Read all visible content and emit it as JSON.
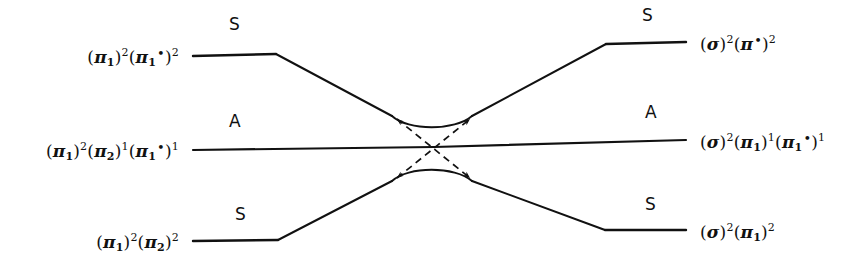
{
  "figure": {
    "type": "orbital-correlation-diagram",
    "background_color": "#ffffff",
    "line_color": "#111111"
  },
  "levels": {
    "left": [
      {
        "id": "left-top",
        "symmetry": "S",
        "config_parts": [
          {
            "t": "(",
            "k": "par"
          },
          {
            "t": "π",
            "k": "gk"
          },
          {
            "t": "1",
            "k": "sub"
          },
          {
            "t": ")",
            "k": "par"
          },
          {
            "t": "2",
            "k": "sup"
          },
          {
            "t": "(",
            "k": "par"
          },
          {
            "t": "π",
            "k": "gk"
          },
          {
            "t": "1",
            "k": "sub"
          },
          {
            "t": "•",
            "k": "star"
          },
          {
            "t": ")",
            "k": "par"
          },
          {
            "t": "2",
            "k": "sup"
          }
        ],
        "config_text": "(π1)2(π1*)2"
      },
      {
        "id": "left-middle",
        "symmetry": "A",
        "config_parts": [
          {
            "t": "(",
            "k": "par"
          },
          {
            "t": "π",
            "k": "gk"
          },
          {
            "t": "1",
            "k": "sub"
          },
          {
            "t": ")",
            "k": "par"
          },
          {
            "t": "2",
            "k": "sup"
          },
          {
            "t": "(",
            "k": "par"
          },
          {
            "t": "π",
            "k": "gk"
          },
          {
            "t": "2",
            "k": "sub"
          },
          {
            "t": ")",
            "k": "par"
          },
          {
            "t": "1",
            "k": "sup"
          },
          {
            "t": "(",
            "k": "par"
          },
          {
            "t": "π",
            "k": "gk"
          },
          {
            "t": "1",
            "k": "sub"
          },
          {
            "t": "•",
            "k": "star"
          },
          {
            "t": ")",
            "k": "par"
          },
          {
            "t": "1",
            "k": "sup"
          }
        ],
        "config_text": "(π1)2(π2)1(π1*)1"
      },
      {
        "id": "left-bottom",
        "symmetry": "S",
        "config_parts": [
          {
            "t": "(",
            "k": "par"
          },
          {
            "t": "π",
            "k": "gk"
          },
          {
            "t": "1",
            "k": "sub"
          },
          {
            "t": ")",
            "k": "par"
          },
          {
            "t": "2",
            "k": "sup"
          },
          {
            "t": "(",
            "k": "par"
          },
          {
            "t": "π",
            "k": "gk"
          },
          {
            "t": "2",
            "k": "sub"
          },
          {
            "t": ")",
            "k": "par"
          },
          {
            "t": "2",
            "k": "sup"
          }
        ],
        "config_text": "(π1)2(π2)2"
      }
    ],
    "right": [
      {
        "id": "right-top",
        "symmetry": "S",
        "config_parts": [
          {
            "t": "(",
            "k": "par"
          },
          {
            "t": "σ",
            "k": "gk"
          },
          {
            "t": ")",
            "k": "par"
          },
          {
            "t": "2",
            "k": "sup"
          },
          {
            "t": "(",
            "k": "par"
          },
          {
            "t": "π",
            "k": "gk"
          },
          {
            "t": "•",
            "k": "star"
          },
          {
            "t": ")",
            "k": "par"
          },
          {
            "t": "2",
            "k": "sup"
          }
        ],
        "config_text": "(σ)2(π*)2"
      },
      {
        "id": "right-middle",
        "symmetry": "A",
        "config_parts": [
          {
            "t": "(",
            "k": "par"
          },
          {
            "t": "σ",
            "k": "gk"
          },
          {
            "t": ")",
            "k": "par"
          },
          {
            "t": "2",
            "k": "sup"
          },
          {
            "t": "(",
            "k": "par"
          },
          {
            "t": "π",
            "k": "gk"
          },
          {
            "t": "1",
            "k": "sub"
          },
          {
            "t": ")",
            "k": "par"
          },
          {
            "t": "1",
            "k": "sup"
          },
          {
            "t": "(",
            "k": "par"
          },
          {
            "t": "π",
            "k": "gk"
          },
          {
            "t": "1",
            "k": "sub"
          },
          {
            "t": "•",
            "k": "star"
          },
          {
            "t": ")",
            "k": "par"
          },
          {
            "t": "1",
            "k": "sup"
          }
        ],
        "config_text": "(σ)2(π1)1(π1*)1"
      },
      {
        "id": "right-bottom",
        "symmetry": "S",
        "config_parts": [
          {
            "t": "(",
            "k": "par"
          },
          {
            "t": "σ",
            "k": "gk"
          },
          {
            "t": ")",
            "k": "par"
          },
          {
            "t": "2",
            "k": "sup"
          },
          {
            "t": "(",
            "k": "par"
          },
          {
            "t": "π",
            "k": "gk"
          },
          {
            "t": "1",
            "k": "sub"
          },
          {
            "t": ")",
            "k": "par"
          },
          {
            "t": "2",
            "k": "sup"
          }
        ],
        "config_text": "(σ)2(π1)2"
      }
    ]
  },
  "symmetry_labels": {
    "left_top": "S",
    "left_middle": "A",
    "left_bottom": "S",
    "right_top": "S",
    "right_middle": "A",
    "right_bottom": "S"
  },
  "geometry": {
    "left_plateau_x": [
      193,
      276
    ],
    "right_plateau_x": [
      606,
      686
    ],
    "left_levels_y": [
      55,
      148,
      240
    ],
    "right_levels_y": [
      42,
      140,
      230
    ],
    "avoided_crossing_center": [
      432,
      148
    ],
    "dashed_lines": 2,
    "solid_correlation_lines": 3
  }
}
